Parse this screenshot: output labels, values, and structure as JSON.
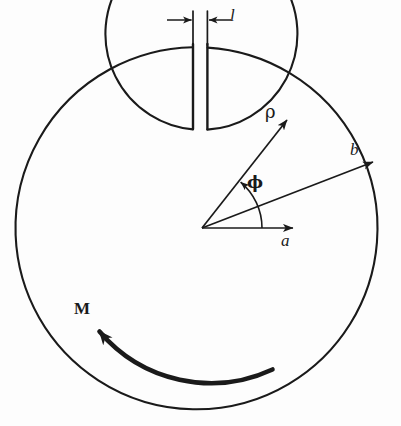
{
  "figure": {
    "background_color": "#fdfdfd",
    "stroke_color": "#1a1a1a",
    "labels": {
      "slot_width": "l",
      "radial_coordinate": "ρ",
      "outer_radius": "b",
      "angle": "ϕ",
      "inner_radius": "a",
      "magnetization": "M"
    },
    "geometry": {
      "canvas_width": 401,
      "canvas_height": 426,
      "center": {
        "x": 203,
        "y": 228
      },
      "outer_circle_radius": 181,
      "inner_circle": {
        "cx": 202,
        "cy": 226,
        "r": 96
      },
      "slot": {
        "left_x": 193,
        "right_x": 207,
        "top_y": 42,
        "bottom_y": 128,
        "width_px": 14
      },
      "dimension_line_y": 20,
      "arrows": [
        {
          "name": "a",
          "angle_deg": 0,
          "tip": {
            "x": 293,
            "y": 228
          }
        },
        {
          "name": "rho",
          "angle_deg": 50,
          "tip": {
            "x": 286,
            "y": 121
          }
        },
        {
          "name": "b",
          "angle_deg": 22,
          "tip": {
            "x": 372,
            "y": 163
          }
        }
      ],
      "angle_arc": {
        "radius": 60,
        "from_deg": 0,
        "to_deg": 50
      },
      "moment_arc": {
        "radius": 140,
        "start_deg": 300,
        "end_deg": 213,
        "direction": "counterclockwise",
        "stroke_width": 5
      }
    }
  }
}
